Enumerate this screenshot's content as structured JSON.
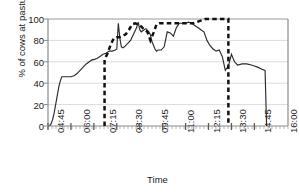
{
  "chart_data": {
    "type": "line",
    "title": "",
    "xlabel": "Time",
    "ylabel": "% of cows at pasture",
    "ylim": [
      0,
      100
    ],
    "yticks": [
      100,
      80,
      60,
      40,
      20,
      0
    ],
    "xticks": [
      "04:45",
      "06:00",
      "07:15",
      "08:30",
      "09:45",
      "11:00",
      "12:15",
      "13:30",
      "14:45",
      "16:00"
    ],
    "grid": "horizontal",
    "legend": "none",
    "colors": {
      "solid_line": "#2b2b2b",
      "dashed_line": "#111111",
      "gridline": "#d9d9d9",
      "axis": "#808080"
    },
    "series": [
      {
        "name": "% of cows at pasture (observed)",
        "style": "solid",
        "x": [
          "04:50",
          "04:55",
          "05:00",
          "05:05",
          "05:10",
          "05:15",
          "05:20",
          "05:25",
          "05:30",
          "05:40",
          "05:50",
          "06:00",
          "06:10",
          "06:20",
          "06:30",
          "06:40",
          "06:50",
          "07:00",
          "07:10",
          "07:15",
          "07:25",
          "07:35",
          "07:45",
          "07:55",
          "08:05",
          "08:15",
          "08:25",
          "08:30",
          "08:35",
          "08:40",
          "08:45",
          "08:50",
          "08:55",
          "09:05",
          "09:15",
          "09:25",
          "09:35",
          "09:40",
          "09:45",
          "09:50",
          "09:55",
          "10:05",
          "10:15",
          "10:20",
          "10:25",
          "10:35",
          "10:40",
          "10:45",
          "10:55",
          "11:05",
          "11:15",
          "11:25",
          "11:35",
          "11:45",
          "11:55",
          "12:05",
          "12:15",
          "12:25",
          "12:35",
          "12:45",
          "12:55",
          "13:05",
          "13:15",
          "13:25",
          "13:35",
          "13:45",
          "13:55",
          "14:05",
          "14:15",
          "14:25",
          "14:35",
          "14:45",
          "14:55",
          "15:05",
          "15:20",
          "15:35",
          "15:50",
          "16:00",
          "16:10",
          "16:25",
          "16:35",
          "16:40"
        ],
        "y": [
          0,
          2,
          6,
          12,
          20,
          28,
          36,
          42,
          46,
          46,
          46,
          46,
          47,
          49,
          52,
          55,
          58,
          60,
          62,
          62,
          63,
          65,
          67,
          68,
          70,
          70,
          71,
          72,
          96,
          82,
          74,
          73,
          74,
          77,
          80,
          86,
          92,
          97,
          90,
          88,
          89,
          91,
          88,
          85,
          79,
          72,
          70,
          71,
          71,
          74,
          88,
          87,
          84,
          92,
          96,
          96,
          96,
          97,
          96,
          94,
          92,
          90,
          88,
          80,
          75,
          72,
          70,
          71,
          65,
          52,
          56,
          67,
          60,
          57,
          58,
          58,
          57,
          56,
          55,
          53,
          52,
          0
        ]
      },
      {
        "name": "Grazing period (modelled)",
        "style": "dashed",
        "x": [
          "07:50",
          "07:50",
          "08:00",
          "08:10",
          "08:20",
          "08:30",
          "08:40",
          "08:50",
          "09:00",
          "09:10",
          "09:20",
          "09:30",
          "09:40",
          "09:50",
          "10:00",
          "10:10",
          "10:20",
          "10:30",
          "10:40",
          "10:50",
          "11:00",
          "11:10",
          "11:20",
          "11:30",
          "11:40",
          "11:50",
          "12:00",
          "12:10",
          "12:20",
          "12:30",
          "12:40",
          "12:50",
          "13:00",
          "13:10",
          "13:20",
          "13:30",
          "13:40",
          "13:50",
          "14:00",
          "14:10",
          "14:20",
          "14:30",
          "14:35",
          "14:35"
        ],
        "y": [
          0,
          62,
          68,
          76,
          82,
          83,
          83,
          84,
          86,
          90,
          95,
          96,
          95,
          93,
          90,
          88,
          80,
          87,
          95,
          96,
          96,
          96,
          96,
          96,
          96,
          96,
          96,
          96,
          96,
          96,
          96,
          97,
          98,
          99,
          100,
          100,
          100,
          100,
          100,
          100,
          100,
          100,
          100,
          0
        ]
      }
    ]
  }
}
